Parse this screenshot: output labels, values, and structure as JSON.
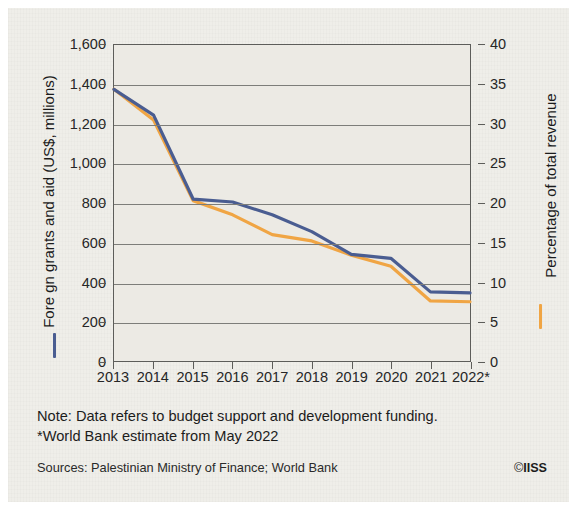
{
  "chart_data": {
    "type": "line",
    "title": "",
    "xlabel": "",
    "categories": [
      "2013",
      "2014",
      "2015",
      "2016",
      "2017",
      "2018",
      "2019",
      "2020",
      "2021",
      "2022*"
    ],
    "grid": true,
    "legend_position": "axis-labels",
    "series": [
      {
        "name": "Fore gn grants and aid (US$, millions)",
        "axis": "left",
        "color": "#4a5d91",
        "ylabel": "Fore gn grants and aid (US$, millions)",
        "ylim": [
          0,
          1600
        ],
        "yticks": [
          "0",
          "200",
          "400",
          "600",
          "800",
          "1,000",
          "1,200",
          "1,400",
          "1,600"
        ],
        "ytick_values": [
          0,
          200,
          400,
          600,
          800,
          1000,
          1200,
          1400,
          1600
        ],
        "values": [
          1375,
          1245,
          820,
          805,
          740,
          655,
          540,
          520,
          350,
          345
        ]
      },
      {
        "name": "Percentage of total revenue",
        "axis": "right",
        "color": "#f0a544",
        "ylabel": "Percentage of total revenue",
        "ylim": [
          0,
          40
        ],
        "yticks": [
          "0",
          "5",
          "10",
          "15",
          "20",
          "25",
          "30",
          "35",
          "40"
        ],
        "ytick_values": [
          0,
          5,
          10,
          15,
          20,
          25,
          30,
          35,
          40
        ],
        "values": [
          34.4,
          30.5,
          20.3,
          18.5,
          16.0,
          15.2,
          13.4,
          12.0,
          7.6,
          7.5
        ]
      }
    ]
  },
  "footer": {
    "note_line_1": "Note: Data refers to budget support and development funding.",
    "note_line_2": "*World Bank estimate from May 2022",
    "sources": "Sources: Palestinian Ministry of Finance; World Bank",
    "copyright_mark": "©",
    "copyright_org": "IISS"
  },
  "colors": {
    "blue_series": "#4a5d91",
    "orange_series": "#f0a544",
    "background": "#efeee9",
    "plot_background": "#eceae4",
    "axis": "#5d5d5a",
    "grid": "#7d7d79"
  }
}
